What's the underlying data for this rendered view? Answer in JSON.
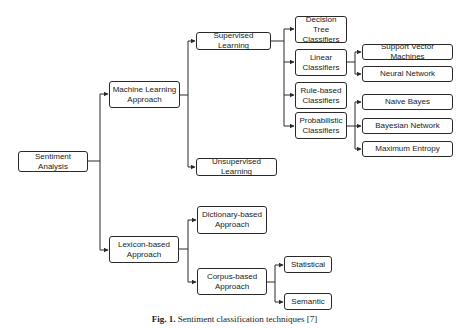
{
  "figure": {
    "caption_label": "Fig. 1.",
    "caption_text": "Sentiment classification techniques [7]"
  },
  "nodes": {
    "root": "Sentiment Analysis",
    "ml": "Machine Learning\nApproach",
    "lex": "Lexicon-based\nApproach",
    "supervised": "Supervised Learning",
    "unsupervised": "Unsupervised Learning",
    "decision_tree": "Decision Tree\nClassifiers",
    "linear": "Linear\nClassifiers",
    "rule_based": "Rule-based\nClassifiers",
    "probabilistic": "Probabilistic\nClassifiers",
    "svm": "Support Vector Machines",
    "neural_network": "Neural Network",
    "naive_bayes": "Naive Bayes",
    "bayesian_network": "Bayesian Network",
    "max_entropy": "Maximum Entropy",
    "dictionary": "Dictionary-based\nApproach",
    "corpus": "Corpus-based\nApproach",
    "statistical": "Statistical",
    "semantic": "Semantic"
  },
  "colors": {
    "line": "#2a2a2a",
    "text": "#1a1a1a",
    "background": "#ffffff"
  }
}
